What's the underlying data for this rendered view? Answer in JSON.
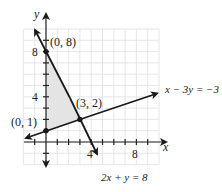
{
  "graph": {
    "axes": {
      "x_label": "x",
      "y_label": "y"
    },
    "ticks": {
      "x_labels": [
        {
          "value": 4,
          "text": "4"
        },
        {
          "value": 8,
          "text": "8"
        }
      ],
      "y_labels": [
        {
          "value": 4,
          "text": "4"
        },
        {
          "value": 8,
          "text": "8"
        }
      ]
    },
    "grid": {
      "x_range": [
        -2,
        10
      ],
      "y_range": [
        -2,
        10
      ],
      "step": 1
    },
    "lines": [
      {
        "equation": "x − 3y = −3",
        "id": "line-1"
      },
      {
        "equation": "2x + y = 8",
        "id": "line-2"
      }
    ],
    "points": [
      {
        "label": "(0, 8)",
        "x": 0,
        "y": 8
      },
      {
        "label": "(3, 2)",
        "x": 3,
        "y": 2
      },
      {
        "label": "(0, 1)",
        "x": 0,
        "y": 1
      }
    ],
    "shaded_region": {
      "vertices": [
        [
          0,
          1
        ],
        [
          0,
          8
        ],
        [
          3,
          2
        ]
      ],
      "color": "#e6e6e6"
    },
    "colors": {
      "grid": "#dddddd",
      "axis": "#222222",
      "line": "#1a1a1a"
    }
  }
}
